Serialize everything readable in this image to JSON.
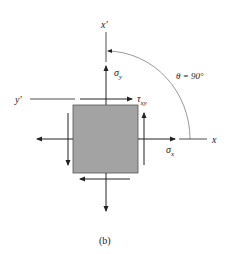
{
  "diagram": {
    "caption": "(b)",
    "angle_label": "θ = 90°",
    "axes": {
      "x": "x",
      "x_prime": "x′",
      "y_prime": "y′"
    },
    "stress_labels": {
      "sigma_x": "σ",
      "sigma_x_sub": "x",
      "sigma_y": "σ",
      "sigma_y_sub": "y",
      "tau_xy": "τ",
      "tau_xy_sub": "xy"
    },
    "colors": {
      "element_fill": "#a3a3a3",
      "element_stroke": "#555555",
      "line": "#222222",
      "background": "#ffffff"
    }
  }
}
